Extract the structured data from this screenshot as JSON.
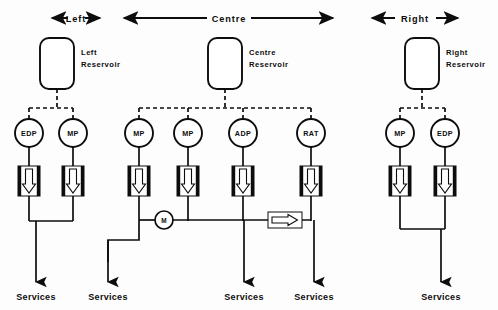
{
  "diagram": {
    "background_color": "#fdfdfd",
    "line_color": "#0d0d0d",
    "spans": [
      {
        "id": "left",
        "label": "Left",
        "x1": 52,
        "x2": 100,
        "y": 18,
        "label_x": 76
      },
      {
        "id": "centre",
        "label": "Centre",
        "x1": 124,
        "x2": 333,
        "y": 18,
        "label_x": 229
      },
      {
        "id": "right",
        "label": "Right",
        "x1": 372,
        "x2": 458,
        "y": 18,
        "label_x": 415
      }
    ],
    "reservoirs": [
      {
        "id": "left-reservoir",
        "label_line1": "Left",
        "label_line2": "Reservoir",
        "x": 40,
        "y": 38,
        "w": 34,
        "h": 51,
        "label_x": 81,
        "label_y": 52
      },
      {
        "id": "centre-reservoir",
        "label_line1": "Centre",
        "label_line2": "Reservoir",
        "x": 208,
        "y": 38,
        "w": 34,
        "h": 51,
        "label_x": 249,
        "label_y": 52
      },
      {
        "id": "right-reservoir",
        "label_line1": "Right",
        "label_line2": "Reservoir",
        "x": 405,
        "y": 38,
        "w": 34,
        "h": 51,
        "label_x": 446,
        "label_y": 52
      }
    ],
    "pumps": [
      {
        "id": "pump-left-edp",
        "label": "EDP",
        "group": "left",
        "cx": 29,
        "cy": 133,
        "r": 14
      },
      {
        "id": "pump-left-mp",
        "label": "MP",
        "group": "left",
        "cx": 73,
        "cy": 133,
        "r": 14
      },
      {
        "id": "pump-centre-mp-1",
        "label": "MP",
        "group": "centre",
        "cx": 139,
        "cy": 133,
        "r": 14
      },
      {
        "id": "pump-centre-mp-2",
        "label": "MP",
        "group": "centre",
        "cx": 188,
        "cy": 133,
        "r": 14
      },
      {
        "id": "pump-centre-adp",
        "label": "ADP",
        "group": "centre",
        "cx": 243,
        "cy": 133,
        "r": 14
      },
      {
        "id": "pump-centre-rat",
        "label": "RAT",
        "group": "centre",
        "cx": 311,
        "cy": 133,
        "r": 14
      },
      {
        "id": "pump-right-mp",
        "label": "MP",
        "group": "right",
        "cx": 400,
        "cy": 133,
        "r": 14
      },
      {
        "id": "pump-right-edp",
        "label": "EDP",
        "group": "right",
        "cx": 445,
        "cy": 133,
        "r": 14
      }
    ],
    "check_valves": [
      {
        "id": "valve-left-edp",
        "cx": 29,
        "cy": 181
      },
      {
        "id": "valve-left-mp",
        "cx": 73,
        "cy": 181
      },
      {
        "id": "valve-centre-mp-1",
        "cx": 139,
        "cy": 181
      },
      {
        "id": "valve-centre-mp-2",
        "cx": 188,
        "cy": 181
      },
      {
        "id": "valve-centre-adp",
        "cx": 243,
        "cy": 181
      },
      {
        "id": "valve-centre-rat",
        "cx": 311,
        "cy": 181
      },
      {
        "id": "valve-right-mp",
        "cx": 400,
        "cy": 181
      },
      {
        "id": "valve-right-edp",
        "cx": 445,
        "cy": 181
      }
    ],
    "motor_pump": {
      "id": "motor-pump",
      "label": "M",
      "cx": 164,
      "cy": 220,
      "r": 9
    },
    "inline_valve": {
      "id": "inline-nonreturn-valve",
      "x": 268,
      "y": 212,
      "w": 34,
      "h": 16
    },
    "outlets": [
      {
        "id": "services-left-1",
        "label": "Services",
        "x": 36,
        "label_y": 297
      },
      {
        "id": "services-left-2",
        "label": "Services",
        "x": 108,
        "label_y": 297
      },
      {
        "id": "services-centre-1",
        "label": "Services",
        "x": 244,
        "label_y": 297
      },
      {
        "id": "services-centre-2",
        "label": "Services",
        "x": 314,
        "label_y": 297
      },
      {
        "id": "services-right-1",
        "label": "Services",
        "x": 441,
        "label_y": 297
      }
    ]
  }
}
